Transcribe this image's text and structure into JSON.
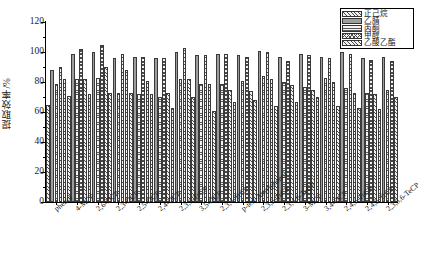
{
  "chart_data": {
    "type": "bar",
    "title": "",
    "xlabel": "",
    "ylabel": "提取效率/%",
    "ylim": [
      0,
      120
    ],
    "yticks": [
      0,
      20,
      40,
      60,
      80,
      100,
      120
    ],
    "grid": false,
    "legend_position": "top-right",
    "categories": [
      "phenol",
      "4-MCP",
      "2,6-DCP",
      "2,3-DCP",
      "2,5-DCP",
      "2,4-DCP",
      "2,3,6-TrCP",
      "3,5-DCP",
      "2,3,4-TrCP",
      "p-tert-Amylphenol",
      "2,3,5-TrCP",
      "2,3,4,6-TeCP",
      "3-MCP",
      "3,4-DCP",
      "2,4,6-TrCP",
      "2,4,5-TrCP",
      "2,3,5,6-TeCP"
    ],
    "series": [
      {
        "name": "正己烷",
        "pattern": "diagonal-hatch",
        "values": [
          65,
          71,
          72,
          73,
          73,
          72,
          63,
          70,
          61,
          67,
          68,
          64,
          67,
          70,
          64,
          63,
          62
        ]
      },
      {
        "name": "乙腈",
        "pattern": "solid-gray",
        "values": [
          88,
          99,
          100,
          96,
          97,
          96,
          100,
          98,
          99,
          98,
          101,
          97,
          99,
          97,
          100,
          96,
          97
        ]
      },
      {
        "name": "丙酮",
        "pattern": "horizontal-lines",
        "values": [
          79,
          82,
          83,
          73,
          72,
          70,
          82,
          79,
          79,
          81,
          84,
          80,
          77,
          83,
          76,
          73,
          75
        ]
      },
      {
        "name": "甲醇",
        "pattern": "solid-gray-dark",
        "values": [
          90,
          102,
          105,
          99,
          97,
          96,
          103,
          98,
          99,
          97,
          100,
          94,
          98,
          96,
          99,
          95,
          94
        ]
      },
      {
        "name": "乙酸乙酯",
        "pattern": "cross-hatch",
        "values": [
          82,
          82,
          90,
          88,
          81,
          73,
          82,
          79,
          75,
          74,
          82,
          78,
          75,
          80,
          73,
          72,
          70
        ]
      }
    ]
  },
  "axis": {
    "y_title": "提取效率/%",
    "y_tick_labels": [
      "0",
      "20",
      "40",
      "60",
      "80",
      "100",
      "120"
    ]
  },
  "legend": {
    "items": [
      {
        "label": "正己烷"
      },
      {
        "label": "乙腈"
      },
      {
        "label": "丙酮"
      },
      {
        "label": "甲醇"
      },
      {
        "label": "乙酸乙酯"
      }
    ]
  }
}
